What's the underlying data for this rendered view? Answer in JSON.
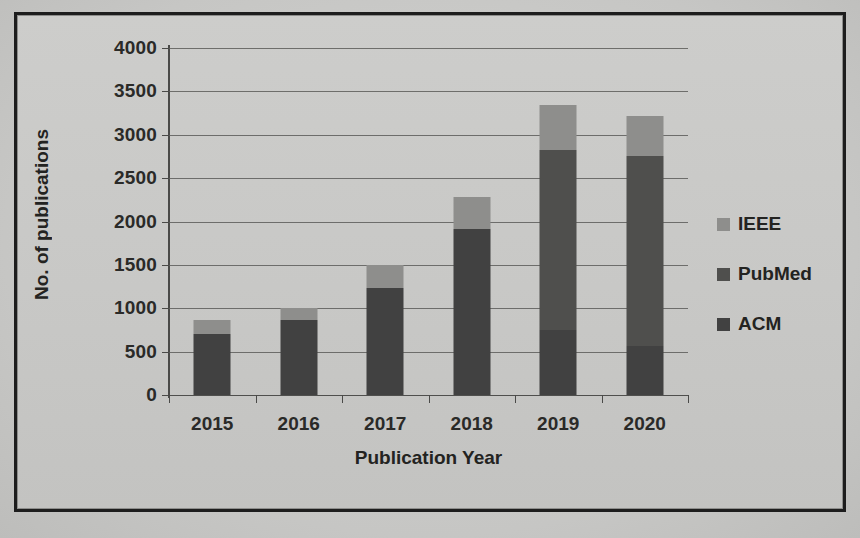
{
  "chart_data": {
    "type": "bar",
    "subtype": "stacked-bar",
    "title": "",
    "xlabel": "Publication Year",
    "ylabel": "No. of publications",
    "categories": [
      "2015",
      "2016",
      "2017",
      "2018",
      "2019",
      "2020"
    ],
    "series": [
      {
        "name": "ACM",
        "color": "#414141",
        "values": [
          700,
          870,
          1235,
          1910,
          750,
          565
        ]
      },
      {
        "name": "PubMed",
        "color": "#4f4f4d",
        "values": [
          0,
          0,
          0,
          0,
          2075,
          2190
        ]
      },
      {
        "name": "IEEE",
        "color": "#8e8e8c",
        "values": [
          170,
          130,
          265,
          370,
          520,
          460
        ]
      }
    ],
    "totals": [
      870,
      1000,
      1500,
      2280,
      3345,
      3215
    ],
    "ylim": [
      0,
      4000
    ],
    "yticks": [
      0,
      500,
      1000,
      1500,
      2000,
      2500,
      3000,
      3500,
      4000
    ],
    "ytick_labels": [
      "0",
      "500",
      "1000",
      "1500",
      "2000",
      "2500",
      "3000",
      "3500",
      "4000"
    ],
    "grid": true,
    "legend_position": "right",
    "legend_order": [
      "IEEE",
      "PubMed",
      "ACM"
    ]
  },
  "axes": {
    "x_title": "Publication Year",
    "y_title": "No. of publications"
  },
  "legend": {
    "items": [
      {
        "label": "IEEE",
        "swatch": "legend-swatch-ieee"
      },
      {
        "label": "PubMed",
        "swatch": "legend-swatch-pubmed"
      },
      {
        "label": "ACM",
        "swatch": "legend-swatch-acm"
      }
    ]
  }
}
